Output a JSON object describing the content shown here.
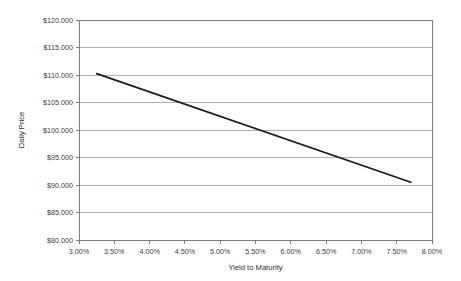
{
  "chart_data": {
    "type": "line",
    "title": "",
    "xlabel": "Yield to Maturity",
    "ylabel": "Daily Price",
    "xlim": [
      3.0,
      8.0
    ],
    "ylim": [
      80.0,
      120.0
    ],
    "grid": true,
    "legend": "none",
    "x_tick_labels": [
      "3.00%",
      "3.50%",
      "4.00%",
      "4.50%",
      "5.00%",
      "5.50%",
      "6.00%",
      "6.50%",
      "7.00%",
      "7.50%",
      "8.00%"
    ],
    "x_tick_values": [
      3.0,
      3.5,
      4.0,
      4.5,
      5.0,
      5.5,
      6.0,
      6.5,
      7.0,
      7.5,
      8.0
    ],
    "y_tick_labels": [
      "$120.000",
      "$115.000",
      "$110.000",
      "$105.000",
      "$100.000",
      "$95.000",
      "$90.000",
      "$85.000",
      "$80.000"
    ],
    "y_tick_values": [
      120.0,
      115.0,
      110.0,
      105.0,
      100.0,
      95.0,
      90.0,
      85.0,
      80.0
    ],
    "series": [
      {
        "name": "Daily Price",
        "color": "#1a1a1a",
        "x": [
          3.25,
          7.7
        ],
        "values": [
          110.25,
          90.5
        ]
      }
    ]
  },
  "colors": {
    "line": "#1a1a1a",
    "grid": "#9b9b9b",
    "border": "#7d7d7d",
    "text": "#3b3b3b",
    "background": "#ffffff"
  }
}
